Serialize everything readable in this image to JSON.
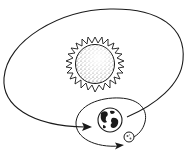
{
  "diagram": {
    "colors": {
      "stroke": "#1a1a1a",
      "background": "#ffffff"
    },
    "elements": [
      {
        "id": "sun",
        "label": "Sun",
        "icon": "sun-icon"
      },
      {
        "id": "earth",
        "label": "Earth",
        "icon": "earth-icon"
      },
      {
        "id": "moon",
        "label": "Moon",
        "icon": "moon-icon"
      },
      {
        "id": "earth-orbit",
        "label": "Earth orbit around Sun"
      },
      {
        "id": "moon-orbit",
        "label": "Moon orbit around Earth"
      }
    ]
  }
}
